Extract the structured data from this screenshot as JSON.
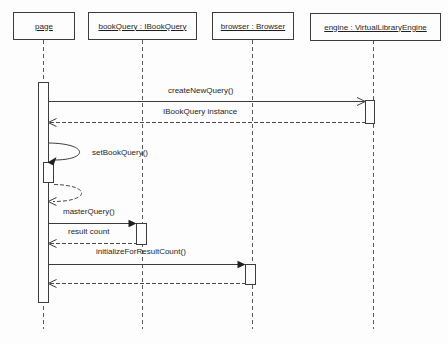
{
  "diagram": {
    "kind": "uml-sequence-diagram",
    "background": "#fdfdfd",
    "line_color": "#3c3c3c",
    "lifeline_dash_color": "#5a5a5a",
    "text_color": "#1f1f1f"
  },
  "lifelines": [
    {
      "label": "page"
    },
    {
      "label": "bookQuery : IBookQuery"
    },
    {
      "label": "browser : Browser"
    },
    {
      "label": "engine : VirtualLibraryEngine"
    }
  ],
  "messages": [
    {
      "label": "createNewQuery()",
      "from": "page",
      "to": "engine",
      "line": "solid",
      "arrowhead": "open",
      "self": false
    },
    {
      "label": "IBookQuery instance",
      "from": "engine",
      "to": "page",
      "line": "dashed",
      "arrowhead": "open",
      "self": false
    },
    {
      "label": "setBookQuery()",
      "from": "page",
      "to": "page",
      "line": "solid",
      "arrowhead": "filled",
      "self": true
    },
    {
      "label": "",
      "from": "page",
      "to": "page",
      "line": "dashed",
      "arrowhead": "open",
      "self": true
    },
    {
      "label": "masterQuery()",
      "from": "page",
      "to": "bookQuery",
      "line": "solid",
      "arrowhead": "filled",
      "self": false
    },
    {
      "label": "result count",
      "from": "bookQuery",
      "to": "page",
      "line": "dashed",
      "arrowhead": "open",
      "self": false
    },
    {
      "label": "initializeForResultCount()",
      "from": "page",
      "to": "browser",
      "line": "solid",
      "arrowhead": "filled",
      "self": false
    },
    {
      "label": "",
      "from": "browser",
      "to": "page",
      "line": "dashed",
      "arrowhead": "open",
      "self": false
    }
  ]
}
